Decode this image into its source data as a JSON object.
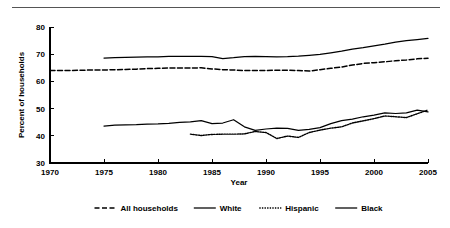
{
  "figure": {
    "y_axis_title": "Percent of households",
    "x_axis_title": "Year"
  },
  "chart_data": {
    "type": "line",
    "title": "",
    "xlabel": "Year",
    "ylabel": "Percent of households",
    "xlim": [
      1970,
      2005
    ],
    "ylim": [
      30,
      80
    ],
    "xticks": [
      1970,
      1975,
      1980,
      1985,
      1990,
      1995,
      2000,
      2005
    ],
    "yticks": [
      30,
      40,
      50,
      60,
      70,
      80
    ],
    "xtick_labels": [
      "1970",
      "1975",
      "1980",
      "1985",
      "1990",
      "1995",
      "2000",
      "2005"
    ],
    "ytick_labels": [
      "30",
      "40",
      "50",
      "60",
      "70",
      "80"
    ],
    "grid": false,
    "legend_position": "bottom",
    "series": [
      {
        "name": "All households",
        "style": "dashed",
        "x": [
          1970,
          1971,
          1972,
          1973,
          1974,
          1975,
          1976,
          1977,
          1978,
          1979,
          1980,
          1981,
          1982,
          1983,
          1984,
          1985,
          1986,
          1987,
          1988,
          1989,
          1990,
          1991,
          1992,
          1993,
          1994,
          1995,
          1996,
          1997,
          1998,
          1999,
          2000,
          2001,
          2002,
          2003,
          2004,
          2005
        ],
        "values": [
          64.0,
          64.0,
          64.0,
          64.1,
          64.2,
          64.2,
          64.3,
          64.4,
          64.5,
          64.7,
          64.8,
          64.9,
          64.9,
          64.9,
          65.0,
          64.6,
          64.3,
          64.2,
          64.0,
          64.0,
          64.0,
          64.1,
          64.1,
          64.0,
          63.8,
          64.3,
          64.8,
          65.3,
          66.0,
          66.6,
          66.9,
          67.2,
          67.6,
          67.9,
          68.3,
          68.5
        ]
      },
      {
        "name": "White",
        "style": "solid",
        "x": [
          1975,
          1976,
          1977,
          1978,
          1979,
          1980,
          1981,
          1982,
          1983,
          1984,
          1985,
          1986,
          1987,
          1988,
          1989,
          1990,
          1991,
          1992,
          1993,
          1994,
          1995,
          1996,
          1997,
          1998,
          1999,
          2000,
          2001,
          2002,
          2003,
          2004,
          2005
        ],
        "values": [
          68.6,
          68.7,
          68.8,
          68.9,
          69.0,
          69.0,
          69.2,
          69.2,
          69.2,
          69.2,
          69.1,
          68.4,
          68.7,
          69.1,
          69.2,
          69.1,
          69.0,
          69.1,
          69.3,
          69.6,
          69.9,
          70.5,
          71.1,
          71.9,
          72.4,
          73.1,
          73.7,
          74.4,
          75.0,
          75.4,
          75.8
        ]
      },
      {
        "name": "Hispanic",
        "style": "dotted",
        "x": [
          1983,
          1984,
          1985,
          1986,
          1987,
          1988,
          1989,
          1990,
          1991,
          1992,
          1993,
          1994,
          1995,
          1996,
          1997,
          1998,
          1999,
          2000,
          2001,
          2002,
          2003,
          2004,
          2005
        ],
        "values": [
          40.6,
          40.1,
          40.5,
          40.6,
          40.6,
          40.7,
          41.6,
          41.2,
          39.0,
          39.9,
          39.4,
          41.2,
          42.1,
          42.8,
          43.3,
          44.7,
          45.5,
          46.3,
          47.3,
          47.0,
          46.7,
          48.1,
          49.5
        ]
      },
      {
        "name": "Black",
        "style": "solid",
        "x": [
          1975,
          1976,
          1977,
          1978,
          1979,
          1980,
          1981,
          1982,
          1983,
          1984,
          1985,
          1986,
          1987,
          1988,
          1989,
          1990,
          1991,
          1992,
          1993,
          1994,
          1995,
          1996,
          1997,
          1998,
          1999,
          2000,
          2001,
          2002,
          2003,
          2004,
          2005
        ],
        "values": [
          43.6,
          43.9,
          44.0,
          44.1,
          44.3,
          44.4,
          44.6,
          44.9,
          45.1,
          45.6,
          44.5,
          44.7,
          45.9,
          43.3,
          42.0,
          42.5,
          42.8,
          42.7,
          42.0,
          42.4,
          43.0,
          44.5,
          45.6,
          46.1,
          47.0,
          47.6,
          48.4,
          48.2,
          48.4,
          49.4,
          48.8
        ]
      }
    ]
  },
  "legend": {
    "entries": [
      {
        "label": "All households",
        "style": "dashed"
      },
      {
        "label": "White",
        "style": "solid"
      },
      {
        "label": "Hispanic",
        "style": "dotted"
      },
      {
        "label": "Black",
        "style": "solid"
      }
    ]
  }
}
